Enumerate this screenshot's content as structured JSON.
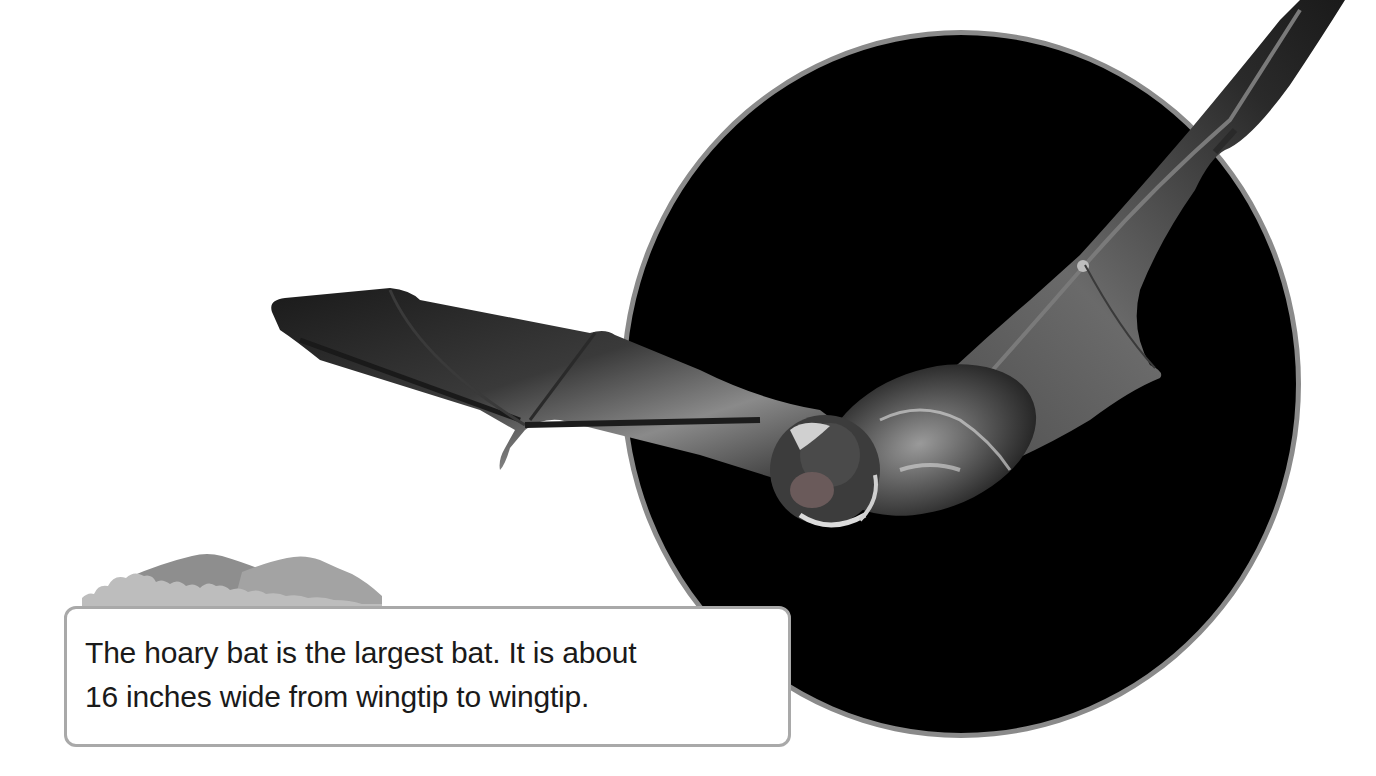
{
  "caption": {
    "lines": [
      "The hoary bat is the largest bat. It is about",
      "16 inches wide from wingtip to wingtip."
    ]
  },
  "illustration": {
    "subject": "hoary-bat-in-flight",
    "backdrop": "black-circle",
    "decoration": "mountains-icon"
  },
  "colors": {
    "circle_fill": "#000000",
    "circle_border": "#8a8a8a",
    "caption_border": "#a9a9a9",
    "mountain_dark": "#8c8c8c",
    "mountain_light": "#b4b4b4",
    "text": "#1a1a1a"
  }
}
